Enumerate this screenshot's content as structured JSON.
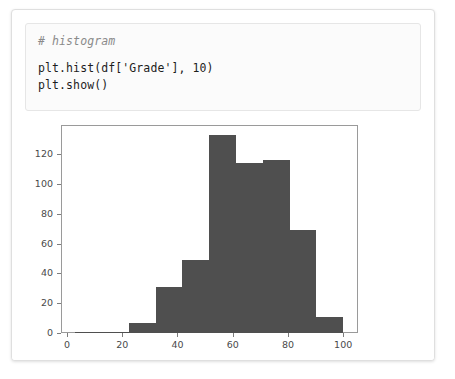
{
  "notebook": {
    "cell": {
      "lines": [
        {
          "text": "# histogram",
          "style": "comment"
        },
        {
          "text": "",
          "style": "blank"
        },
        {
          "text": "plt.hist(df['Grade'], 10)",
          "style": "code"
        },
        {
          "text": "plt.show()",
          "style": "code"
        }
      ]
    }
  },
  "colors": {
    "bar": "#4f4f4f",
    "axis": "#9a9a9a",
    "tick_text": "#4a4a4a",
    "comment": "#8a8a8a",
    "code": "#1d1d1d",
    "cell_background": "#fbfbfb",
    "card_border": "#dfdfdf"
  },
  "chart_data": {
    "type": "bar",
    "title": "",
    "xlabel": "",
    "ylabel": "",
    "xlim": [
      -1.8,
      105.0
    ],
    "ylim": [
      0,
      139
    ],
    "grid": false,
    "legend": null,
    "bin_edges": [
      3.0,
      12.7,
      22.4,
      32.1,
      41.8,
      51.5,
      61.2,
      70.9,
      80.6,
      90.3,
      100.0
    ],
    "categories": [
      "3.0-12.7",
      "12.7-22.4",
      "22.4-32.1",
      "32.1-41.8",
      "41.8-51.5",
      "51.5-61.2",
      "61.2-70.9",
      "70.9-80.6",
      "80.6-90.3",
      "90.3-100.0"
    ],
    "values": [
      1,
      1,
      7,
      31,
      49,
      133,
      114,
      116,
      69,
      11
    ],
    "xticks": [
      0,
      20,
      40,
      60,
      80,
      100
    ],
    "xtick_labels": [
      "0",
      "20",
      "40",
      "60",
      "80",
      "100"
    ],
    "yticks": [
      0,
      20,
      40,
      60,
      80,
      100,
      120
    ],
    "ytick_labels": [
      "0",
      "20",
      "40",
      "60",
      "80",
      "100",
      "120"
    ]
  }
}
